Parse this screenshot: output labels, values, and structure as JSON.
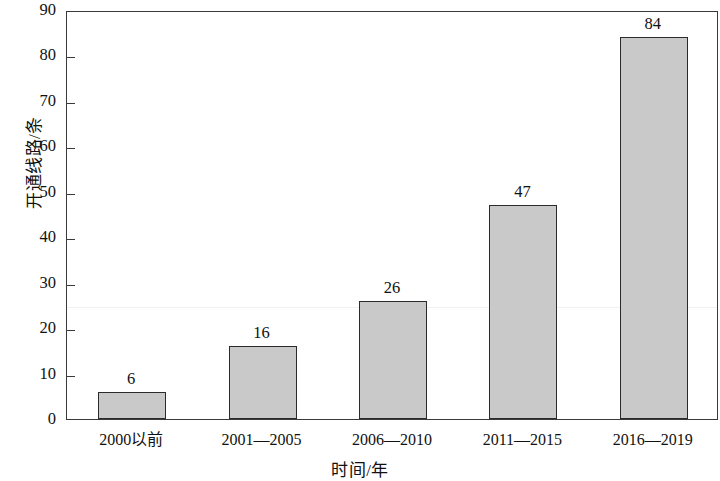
{
  "chart_data": {
    "type": "bar",
    "title": "",
    "subtitle": "",
    "categories": [
      "2000以前",
      "2001—2005",
      "2006—2010",
      "2011—2015",
      "2016—2019"
    ],
    "values": [
      6,
      16,
      26,
      47,
      84
    ],
    "data_labels": [
      "6",
      "16",
      "26",
      "47",
      "84"
    ],
    "xlabel": "时间/年",
    "ylabel": "开通线路/条",
    "ylim": [
      0,
      90
    ],
    "ytick_step": 10,
    "ytick_labels": [
      "0",
      "10",
      "20",
      "30",
      "40",
      "50",
      "60",
      "70",
      "80",
      "90"
    ],
    "ytick_values": [
      0,
      10,
      20,
      30,
      40,
      50,
      60,
      70,
      80,
      90
    ],
    "grid": false,
    "legend": null,
    "legend_position": "none",
    "bar_fill_color": "#c9c9c9",
    "bar_edge_color": "#2b2b2b",
    "axis_color": "#3a3a3a",
    "background_color": "#ffffff",
    "text_color": "#111111"
  }
}
